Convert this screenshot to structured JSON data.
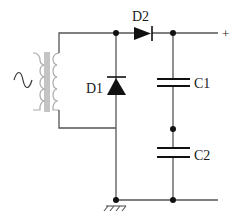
{
  "diagram": {
    "type": "circuit-schematic",
    "components": {
      "source": {
        "label": "",
        "symbol": "ac-source-icon"
      },
      "transformer": {
        "label": ""
      },
      "D1": {
        "label": "D1",
        "type": "diode"
      },
      "D2": {
        "label": "D2",
        "type": "diode"
      },
      "C1": {
        "label": "C1",
        "type": "capacitor"
      },
      "C2": {
        "label": "C2",
        "type": "capacitor"
      }
    },
    "terminals": {
      "positive": "+"
    },
    "ac_symbol": "~",
    "colors": {
      "wire": "#555555",
      "component": "#111111",
      "transformer": "#aaaaaa"
    }
  }
}
